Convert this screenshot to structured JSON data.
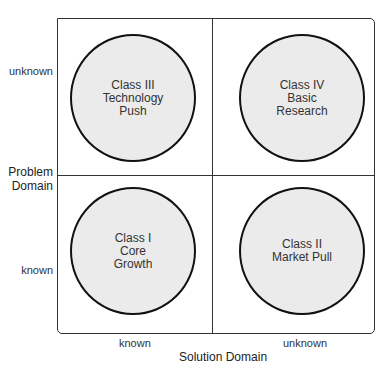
{
  "diagram": {
    "x_axis": {
      "title": "Solution Domain",
      "ticks": [
        "known",
        "unknown"
      ]
    },
    "y_axis": {
      "title_line1": "Problem",
      "title_line2": "Domain",
      "ticks": [
        "unknown",
        "known"
      ]
    },
    "quadrants": [
      {
        "position": "top-left",
        "lines": [
          "Class III",
          "Technology",
          "Push"
        ]
      },
      {
        "position": "top-right",
        "lines": [
          "Class IV",
          "Basic",
          "Research"
        ]
      },
      {
        "position": "bottom-left",
        "lines": [
          "Class I",
          "Core",
          "Growth"
        ]
      },
      {
        "position": "bottom-right",
        "lines": [
          "Class II",
          "Market Pull"
        ]
      }
    ],
    "colors": {
      "circle_fill": "#ebebeb",
      "stroke": "#111111"
    }
  }
}
